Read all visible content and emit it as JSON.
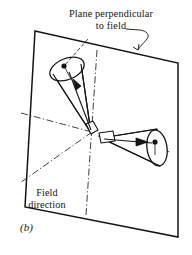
{
  "figure": {
    "label": "(b)",
    "annotations": {
      "plane_label_line1": "Plane perpendicular",
      "plane_label_line2": "to field",
      "field_label_line1": "Field",
      "field_label_line2": "direction"
    },
    "colors": {
      "ink": "#141414",
      "paper": "#ffffff",
      "dash_dot": "#2a2a2a"
    },
    "elements": {
      "plane_name": "perpendicular plane parallelogram",
      "upper_cone_name": "upper-left radiation cone",
      "lower_cone_name": "lower-right radiation cone",
      "axis_name": "field axis dash-dot lines",
      "leader_name": "curved leader line to plane"
    }
  }
}
